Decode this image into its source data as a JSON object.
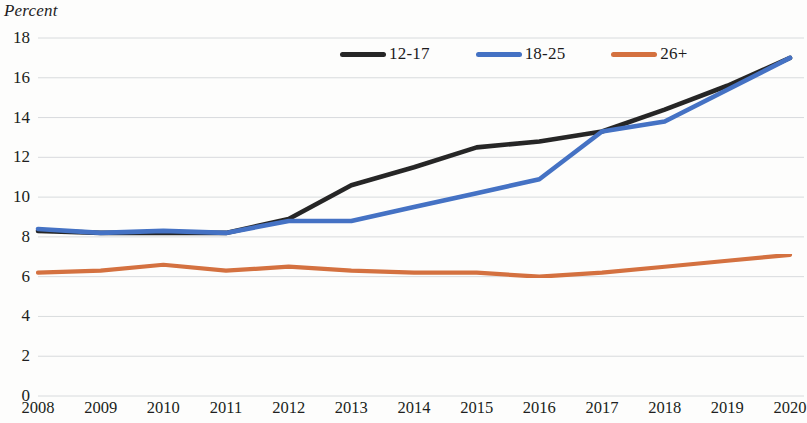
{
  "axis_title": "Percent",
  "title_remnant": "",
  "legend": {
    "position": "top-center",
    "entries": [
      {
        "label": "12-17",
        "color": "#262626",
        "name": "series-12-17"
      },
      {
        "label": "18-25",
        "color": "#4472c4",
        "name": "series-18-25"
      },
      {
        "label": "26+",
        "color": "#d4713f",
        "name": "series-26plus"
      }
    ]
  },
  "chart_data": {
    "type": "line",
    "title": "",
    "xlabel": "",
    "ylabel": "Percent",
    "categories": [
      "2008",
      "2009",
      "2010",
      "2011",
      "2012",
      "2013",
      "2014",
      "2015",
      "2016",
      "2017",
      "2018",
      "2019",
      "2020"
    ],
    "x_tick_labels": [
      "2008",
      "2009",
      "2010",
      "2011",
      "2012",
      "2013",
      "2014",
      "2015",
      "2016",
      "2017",
      "2018",
      "2019",
      "2020"
    ],
    "y_tick_labels": [
      "0",
      "2",
      "4",
      "6",
      "8",
      "10",
      "12",
      "14",
      "16",
      "18"
    ],
    "y_ticks": [
      0,
      2,
      4,
      6,
      8,
      10,
      12,
      14,
      16,
      18
    ],
    "ylim": [
      0,
      18
    ],
    "grid": true,
    "grid_axis": "y",
    "legend_position": "top-center",
    "series": [
      {
        "name": "12-17",
        "color": "#262626",
        "values": [
          8.3,
          8.2,
          8.2,
          8.2,
          8.9,
          10.6,
          11.5,
          12.5,
          12.8,
          13.3,
          14.4,
          15.6,
          17.0
        ]
      },
      {
        "name": "18-25",
        "color": "#4472c4",
        "values": [
          8.4,
          8.2,
          8.3,
          8.2,
          8.8,
          8.8,
          9.5,
          10.2,
          10.9,
          13.3,
          13.8,
          15.4,
          17.0
        ]
      },
      {
        "name": "26+",
        "color": "#d4713f",
        "values": [
          6.2,
          6.3,
          6.6,
          6.3,
          6.5,
          6.3,
          6.2,
          6.2,
          6.0,
          6.2,
          6.5,
          6.8,
          7.1
        ]
      }
    ]
  },
  "plot_geometry": {
    "left": 38,
    "right": 790,
    "top": 38,
    "bottom": 396
  }
}
